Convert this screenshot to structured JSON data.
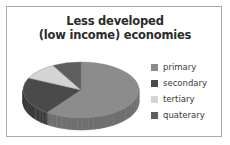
{
  "card": {
    "border_color": "#a9a9a9",
    "background": "#ffffff"
  },
  "title": {
    "line1": "Less developed",
    "line2": "(low income) economies",
    "color": "#2b2b2b"
  },
  "legend": {
    "items": [
      {
        "label": "primary",
        "color": "#8c8c8c"
      },
      {
        "label": "secondary",
        "color": "#4a4a4a"
      },
      {
        "label": "tertiary",
        "color": "#d4d4d4"
      },
      {
        "label": "quaterary",
        "color": "#5e5e5e"
      }
    ]
  },
  "chart_data": {
    "type": "pie",
    "title": "Less developed (low income) economies",
    "labels": [
      "primary",
      "secondary",
      "tertiary",
      "quaterary"
    ],
    "values": [
      60,
      22,
      10,
      8
    ],
    "unit": "percent",
    "colors": [
      "#8c8c8c",
      "#4a4a4a",
      "#d4d4d4",
      "#5e5e5e"
    ],
    "side_colors": [
      "#6f6f6f",
      "#3a3a3a",
      "#a8a8a8",
      "#4a4a4a"
    ],
    "three_d": true,
    "start_angle_deg": 0,
    "direction": "clockwise",
    "legend_position": "right",
    "grid": false
  }
}
